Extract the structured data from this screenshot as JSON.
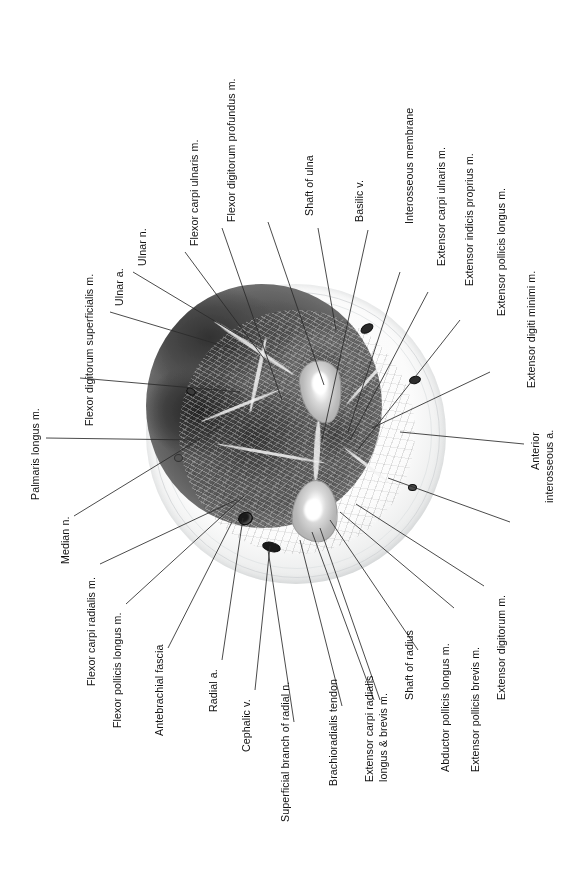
{
  "figure": {
    "type": "anatomical-cross-section",
    "region": "Forearm (antebrachium) transverse section",
    "orientation": "rotated 90 degrees; all labels read bottom-to-top",
    "colors": {
      "background": "#ffffff",
      "leader_line": "#2b2b2b",
      "label_text": "#111111",
      "tissue_dark": "#3d3d3d",
      "tissue_mid": "#6a6a6a",
      "bone_cortex": "#b9b9b9",
      "marrow": "#ffffff",
      "vessel_lumen": "#1a1a1a",
      "embedding_rim": "#eceded"
    }
  },
  "labels": [
    {
      "id": "flexor-digitorum-profundus",
      "text": "Flexor digitorum profundus m."
    },
    {
      "id": "flexor-carpi-ulnaris",
      "text": "Flexor carpi ulnaris m."
    },
    {
      "id": "ulnar-n",
      "text": "Ulnar n."
    },
    {
      "id": "ulnar-a",
      "text": "Ulnar a."
    },
    {
      "id": "flexor-digitorum-superficialis",
      "text": "Flexor digitorum superficialis m."
    },
    {
      "id": "palmaris-longus",
      "text": "Palmaris longus m."
    },
    {
      "id": "median-n",
      "text": "Median n."
    },
    {
      "id": "flexor-carpi-radialis",
      "text": "Flexor carpi radialis m."
    },
    {
      "id": "flexor-pollicis-longus",
      "text": "Flexor pollicis longus m."
    },
    {
      "id": "antebrachial-fascia",
      "text": "Antebrachial fascia"
    },
    {
      "id": "radial-a",
      "text": "Radial a."
    },
    {
      "id": "cephalic-v",
      "text": "Cephalic v."
    },
    {
      "id": "superficial-branch-radial-n",
      "text": "Superficial branch of radial n."
    },
    {
      "id": "brachioradialis-tendon",
      "text": "Brachioradialis tendon"
    },
    {
      "id": "extensor-carpi-radialis-l1",
      "text": "Extensor carpi radialis"
    },
    {
      "id": "extensor-carpi-radialis-l2",
      "text": "longus & brevis m."
    },
    {
      "id": "shaft-of-radius",
      "text": "Shaft of radius"
    },
    {
      "id": "abductor-pollicis-longus",
      "text": "Abductor pollicis longus m."
    },
    {
      "id": "extensor-pollicis-brevis",
      "text": "Extensor pollicis brevis m."
    },
    {
      "id": "extensor-digitorum",
      "text": "Extensor digitorum m."
    },
    {
      "id": "anterior-interosseous-a-l1",
      "text": "Anterior"
    },
    {
      "id": "anterior-interosseous-a-l2",
      "text": "interosseous a."
    },
    {
      "id": "extensor-digiti-minimi",
      "text": "Extensor digiti minimi m."
    },
    {
      "id": "extensor-pollicis-longus",
      "text": "Extensor pollicis longus m."
    },
    {
      "id": "extensor-indicis-proprius",
      "text": "Extensor indicis proprius m."
    },
    {
      "id": "extensor-carpi-ulnaris",
      "text": "Extensor carpi ulnaris m."
    },
    {
      "id": "interosseous-membrane",
      "text": "Interosseous membrane"
    },
    {
      "id": "basilic-v",
      "text": "Basilic v."
    },
    {
      "id": "shaft-of-ulna",
      "text": "Shaft of ulna"
    }
  ]
}
